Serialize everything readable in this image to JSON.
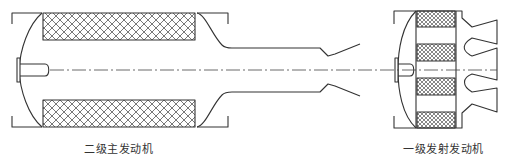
{
  "diagram": {
    "type": "two-stage solid rocket motor schematic",
    "colors": {
      "stroke": "#333333",
      "hatch": "#555555",
      "background": "#ffffff"
    },
    "labels": {
      "second_stage": "二级主发动机",
      "first_stage": "一级发射发动机"
    },
    "components": {
      "second_stage_motor": {
        "grain_blocks": 2,
        "hatch": "crosshatch",
        "igniter": true,
        "nozzle": "long blast tube with expansion cone"
      },
      "first_stage_motor": {
        "grain_blocks": 4,
        "hatch": "fine crosshatch",
        "igniter": true,
        "nozzles": 3
      }
    },
    "centerline": "dash-dot"
  }
}
